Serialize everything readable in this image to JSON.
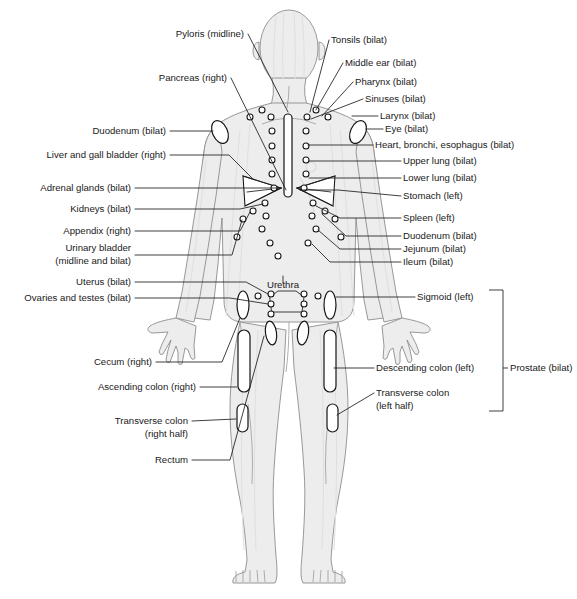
{
  "diagram": {
    "body_fill_color": "#ededed",
    "body_outline_color": "#8d8d8d",
    "leader_line_color": "#1d1d1d",
    "marker_fill_color": "#ffffff",
    "marker_stroke_color": "#151515",
    "label_text_color": "#1a1a1a"
  },
  "labels_left": [
    {
      "id": "pyloris",
      "text": "Pyloris (midline)",
      "x": 244,
      "y": 34,
      "anchor": "end"
    },
    {
      "id": "pancreas",
      "text": "Pancreas (right)",
      "x": 227,
      "y": 78,
      "anchor": "end"
    },
    {
      "id": "duodenum-left",
      "text": "Duodenum (bilat)",
      "x": 166,
      "y": 131,
      "anchor": "end"
    },
    {
      "id": "liver",
      "text": "Liver and gall bladder (right)",
      "x": 166,
      "y": 155,
      "anchor": "end"
    },
    {
      "id": "adrenal",
      "text": "Adrenal glands (bilat)",
      "x": 131,
      "y": 188,
      "anchor": "end"
    },
    {
      "id": "kidneys",
      "text": "Kidneys (bilat)",
      "x": 131,
      "y": 209,
      "anchor": "end"
    },
    {
      "id": "appendix",
      "text": "Appendix (right)",
      "x": 131,
      "y": 231,
      "anchor": "end"
    },
    {
      "id": "bladder-1",
      "text": "Urinary bladder",
      "x": 131,
      "y": 248,
      "anchor": "end"
    },
    {
      "id": "bladder-2",
      "text": "(midline and bilat)",
      "x": 131,
      "y": 261,
      "anchor": "end"
    },
    {
      "id": "uterus",
      "text": "Uterus (bilat)",
      "x": 131,
      "y": 282,
      "anchor": "end"
    },
    {
      "id": "ovaries",
      "text": "Ovaries and testes (bilat)",
      "x": 131,
      "y": 298,
      "anchor": "end"
    },
    {
      "id": "cecum",
      "text": "Cecum (right)",
      "x": 152,
      "y": 362,
      "anchor": "end"
    },
    {
      "id": "ascending",
      "text": "Ascending colon (right)",
      "x": 196,
      "y": 387,
      "anchor": "end"
    },
    {
      "id": "transverse-r1",
      "text": "Transverse colon",
      "x": 188,
      "y": 421,
      "anchor": "end"
    },
    {
      "id": "transverse-r2",
      "text": "(right half)",
      "x": 188,
      "y": 434,
      "anchor": "end"
    },
    {
      "id": "rectum",
      "text": "Rectum",
      "x": 188,
      "y": 460,
      "anchor": "end"
    }
  ],
  "labels_right": [
    {
      "id": "tonsils",
      "text": "Tonsils (bilat)",
      "x": 331,
      "y": 40,
      "anchor": "start"
    },
    {
      "id": "middle-ear",
      "text": "Middle ear (bilat)",
      "x": 345,
      "y": 63,
      "anchor": "start"
    },
    {
      "id": "pharynx",
      "text": "Pharynx (bilat)",
      "x": 355,
      "y": 82,
      "anchor": "start"
    },
    {
      "id": "sinuses",
      "text": "Sinuses (bilat)",
      "x": 365,
      "y": 99,
      "anchor": "start"
    },
    {
      "id": "larynx",
      "text": "Larynx (bilat)",
      "x": 380,
      "y": 116,
      "anchor": "start"
    },
    {
      "id": "eye",
      "text": "Eye (bilat)",
      "x": 385,
      "y": 129,
      "anchor": "start"
    },
    {
      "id": "heart",
      "text": "Heart, bronchi, esophagus (bilat)",
      "x": 375,
      "y": 145,
      "anchor": "start"
    },
    {
      "id": "upper-lung",
      "text": "Upper lung (bilat)",
      "x": 403,
      "y": 161,
      "anchor": "start"
    },
    {
      "id": "lower-lung",
      "text": "Lower lung (bilat)",
      "x": 403,
      "y": 178,
      "anchor": "start"
    },
    {
      "id": "stomach",
      "text": "Stomach (left)",
      "x": 403,
      "y": 196,
      "anchor": "start"
    },
    {
      "id": "spleen",
      "text": "Spleen (left)",
      "x": 403,
      "y": 218,
      "anchor": "start"
    },
    {
      "id": "duodenum-right",
      "text": "Duodenum (bilat)",
      "x": 403,
      "y": 236,
      "anchor": "start"
    },
    {
      "id": "jejunum",
      "text": "Jejunum (bilat)",
      "x": 403,
      "y": 249,
      "anchor": "start"
    },
    {
      "id": "ileum",
      "text": "Ileum (bilat)",
      "x": 403,
      "y": 262,
      "anchor": "start"
    },
    {
      "id": "sigmoid",
      "text": "Sigmoid (left)",
      "x": 417,
      "y": 297,
      "anchor": "start"
    },
    {
      "id": "descending",
      "text": "Descending colon (left)",
      "x": 376,
      "y": 368,
      "anchor": "start"
    },
    {
      "id": "transverse-l1",
      "text": "Transverse colon",
      "x": 376,
      "y": 393,
      "anchor": "start"
    },
    {
      "id": "transverse-l2",
      "text": "(left half)",
      "x": 376,
      "y": 406,
      "anchor": "start"
    },
    {
      "id": "prostate",
      "text": "Prostate (bilat)",
      "x": 510,
      "y": 368,
      "anchor": "start"
    }
  ],
  "labels_inline": [
    {
      "id": "urethra",
      "text": "Urethra",
      "x": 283,
      "y": 285,
      "anchor": "middle"
    }
  ]
}
